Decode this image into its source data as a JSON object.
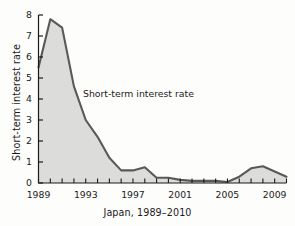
{
  "chart_data": {
    "type": "area",
    "title": "",
    "subtitle": "",
    "xlabel": "Japan, 1989–2010",
    "ylabel": "Short-term interest rate",
    "annotation": "Short-term interest rate",
    "series_name": "Short-term interest rate",
    "x": [
      1989,
      1990,
      1991,
      1992,
      1993,
      1994,
      1995,
      1996,
      1997,
      1998,
      1999,
      2000,
      2001,
      2002,
      2003,
      2004,
      2005,
      2006,
      2007,
      2008,
      2009,
      2010
    ],
    "values": [
      5.5,
      7.8,
      7.4,
      4.6,
      3.0,
      2.2,
      1.2,
      0.6,
      0.6,
      0.75,
      0.25,
      0.25,
      0.15,
      0.1,
      0.1,
      0.1,
      0.05,
      0.3,
      0.7,
      0.8,
      0.55,
      0.3
    ],
    "xlim": [
      1989,
      2010
    ],
    "ylim": [
      0,
      8
    ],
    "yticks": [
      0,
      1,
      2,
      3,
      4,
      5,
      6,
      7,
      8
    ],
    "ytick_labels": [
      "0",
      "1",
      "2",
      "3",
      "4",
      "5",
      "6",
      "7",
      "8"
    ],
    "xticks": [
      1989,
      1990,
      1991,
      1992,
      1993,
      1994,
      1995,
      1996,
      1997,
      1998,
      1999,
      2000,
      2001,
      2002,
      2003,
      2004,
      2005,
      2006,
      2007,
      2008,
      2009,
      2010
    ],
    "xtick_labels_shown": [
      "1989",
      "1993",
      "1997",
      "2001",
      "2005",
      "2009"
    ],
    "xtick_labels_shown_values": [
      1989,
      1993,
      1997,
      2001,
      2005,
      2009
    ],
    "grid": false,
    "legend": "none",
    "colors": {
      "line": "#595959",
      "fill": "#dcdcda",
      "axis": "#1b1b1b",
      "text": "#1b1b1b",
      "background": "#fdfdfc"
    }
  },
  "ticks": {
    "y": [
      "8",
      "7",
      "6",
      "5",
      "4",
      "3",
      "2",
      "1",
      "0"
    ],
    "x": [
      "1989",
      "1993",
      "1997",
      "2001",
      "2005",
      "2009"
    ]
  }
}
